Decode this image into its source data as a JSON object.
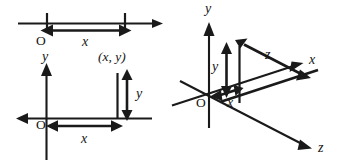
{
  "figure": {
    "background_color": "#ffffff",
    "ink_color": "#1a1a1a",
    "panels": [
      {
        "id": "one-dimension",
        "name": "1D number line",
        "labels": {
          "origin": "O",
          "distance": "x"
        }
      },
      {
        "id": "two-dimension",
        "name": "2D cartesian plane",
        "labels": {
          "origin": "O",
          "y_axis": "y",
          "point": "(x, y)",
          "horizontal_distance": "x",
          "vertical_distance": "y"
        }
      },
      {
        "id": "three-dimension",
        "name": "3D cartesian axes",
        "labels": {
          "origin": "O",
          "y_axis": "y",
          "x_axis": "x",
          "z_axis": "z",
          "x_distance": "x",
          "y_distance": "y",
          "z_distance": "z"
        }
      }
    ]
  }
}
